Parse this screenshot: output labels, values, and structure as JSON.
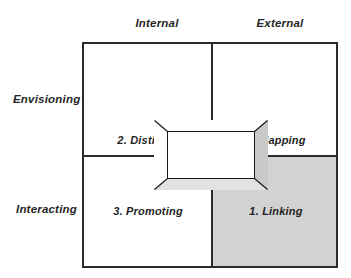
{
  "diagram": {
    "type": "2x2-matrix",
    "columns": [
      {
        "id": "internal",
        "label": "Internal"
      },
      {
        "id": "external",
        "label": "External"
      }
    ],
    "rows": [
      {
        "id": "envisioning",
        "label": "Envisioning"
      },
      {
        "id": "interacting",
        "label": "Interacting"
      }
    ],
    "quadrants": [
      {
        "id": "distilling",
        "label": "2. Distilling",
        "row": "envisioning",
        "column": "internal",
        "shaded": false
      },
      {
        "id": "mapping",
        "label": "4. Mapping",
        "row": "envisioning",
        "column": "external",
        "shaded": false
      },
      {
        "id": "promoting",
        "label": "3. Promoting",
        "row": "interacting",
        "column": "internal",
        "shaded": false
      },
      {
        "id": "linking",
        "label": "1. Linking",
        "row": "interacting",
        "column": "external",
        "shaded": true
      }
    ],
    "center_element": {
      "id": "center-frame",
      "shape": "beveled-rectangle",
      "label": ""
    },
    "colors": {
      "background": "#ffffff",
      "line": "#2b2b2b",
      "text": "#262626",
      "shaded_cell": "#d2d2d2",
      "bevel_light": "#ffffff",
      "bevel_right": "#c9c9c9",
      "bevel_bottom": "#e2e2e2"
    }
  }
}
